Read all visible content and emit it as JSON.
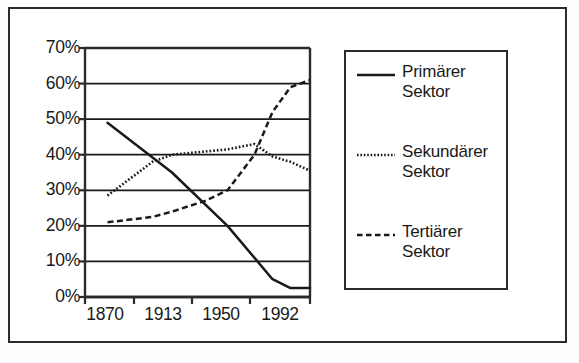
{
  "chart_data": {
    "type": "line",
    "title": "",
    "xlabel": "",
    "ylabel": "",
    "x": [
      1870,
      1913,
      1950,
      1992
    ],
    "x_tick_labels": [
      "1870",
      "1913",
      "1950",
      "1992"
    ],
    "y_tick_labels": [
      "0%",
      "10%",
      "20%",
      "30%",
      "40%",
      "50%",
      "60%",
      "70%"
    ],
    "y_tick_values": [
      0,
      10,
      20,
      30,
      40,
      50,
      60,
      70
    ],
    "ylim": [
      0,
      70
    ],
    "xlim": [
      1855,
      2005
    ],
    "grid": "horizontal",
    "legend_position": "right",
    "series": [
      {
        "name": "Primärer Sektor",
        "label_line1": "Primärer",
        "label_line2": "Sektor",
        "style": "solid",
        "color": "#1a1a1a",
        "values": [
          49,
          35,
          20,
          2.5
        ],
        "points": [
          {
            "x": 1870,
            "y": 49
          },
          {
            "x": 1913,
            "y": 35
          },
          {
            "x": 1950,
            "y": 20
          },
          {
            "x": 1980,
            "y": 5
          },
          {
            "x": 1992,
            "y": 2.5
          },
          {
            "x": 2005,
            "y": 2.5
          }
        ]
      },
      {
        "name": "Sekundärer Sektor",
        "label_line1": "Sekundärer",
        "label_line2": "Sektor",
        "style": "dotted",
        "color": "#1a1a1a",
        "values": [
          28.5,
          40,
          41.5,
          36
        ],
        "points": [
          {
            "x": 1870,
            "y": 28.5
          },
          {
            "x": 1900,
            "y": 38
          },
          {
            "x": 1913,
            "y": 40
          },
          {
            "x": 1950,
            "y": 41.5
          },
          {
            "x": 1968,
            "y": 43
          },
          {
            "x": 1980,
            "y": 39.5
          },
          {
            "x": 1992,
            "y": 38
          },
          {
            "x": 2005,
            "y": 35.5
          }
        ]
      },
      {
        "name": "Tertiärer Sektor",
        "label_line1": "Tertiärer",
        "label_line2": "Sektor",
        "style": "dashed",
        "color": "#1a1a1a",
        "values": [
          21,
          23,
          30,
          60
        ],
        "points": [
          {
            "x": 1870,
            "y": 21
          },
          {
            "x": 1900,
            "y": 22.5
          },
          {
            "x": 1913,
            "y": 24
          },
          {
            "x": 1935,
            "y": 27
          },
          {
            "x": 1950,
            "y": 30
          },
          {
            "x": 1968,
            "y": 40
          },
          {
            "x": 1980,
            "y": 52
          },
          {
            "x": 1992,
            "y": 59
          },
          {
            "x": 2005,
            "y": 61
          }
        ]
      }
    ]
  },
  "axes": {
    "frame_color": "#2b2b2b",
    "gridline_color": "#1a1a1a"
  }
}
